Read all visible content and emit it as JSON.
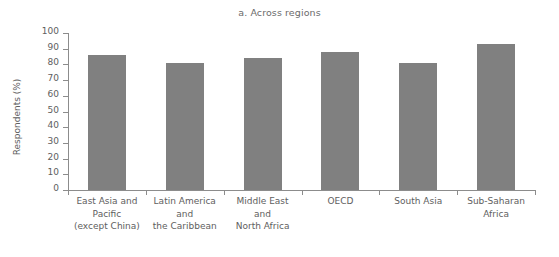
{
  "chart_data": {
    "type": "bar",
    "title": "a. Across regions",
    "xlabel": "",
    "ylabel": "Respondents (%)",
    "ylim": [
      0,
      100
    ],
    "ytick_step": 10,
    "grid": false,
    "legend": null,
    "bar_color": "#808080",
    "axis_color": "#8c8c8c",
    "text_color": "#5e5e5e",
    "categories": [
      "East Asia and Pacific (except China)",
      "Latin America and the Caribbean",
      "Middle East and North Africa",
      "OECD",
      "South Asia",
      "Sub-Saharan Africa"
    ],
    "category_label_lines": [
      [
        "East Asia and",
        "Pacific",
        "(except China)"
      ],
      [
        "Latin America",
        "and",
        "the Caribbean"
      ],
      [
        "Middle East",
        "and",
        "North Africa"
      ],
      [
        "OECD"
      ],
      [
        "South Asia"
      ],
      [
        "Sub-Saharan",
        "Africa"
      ]
    ],
    "values": [
      86,
      81,
      84,
      88,
      81,
      93
    ],
    "ytick_labels": [
      "100",
      "90",
      "80",
      "70",
      "60",
      "50",
      "40",
      "30",
      "20",
      "10",
      "0"
    ],
    "ytick_values": [
      100,
      90,
      80,
      70,
      60,
      50,
      40,
      30,
      20,
      10,
      0
    ]
  }
}
